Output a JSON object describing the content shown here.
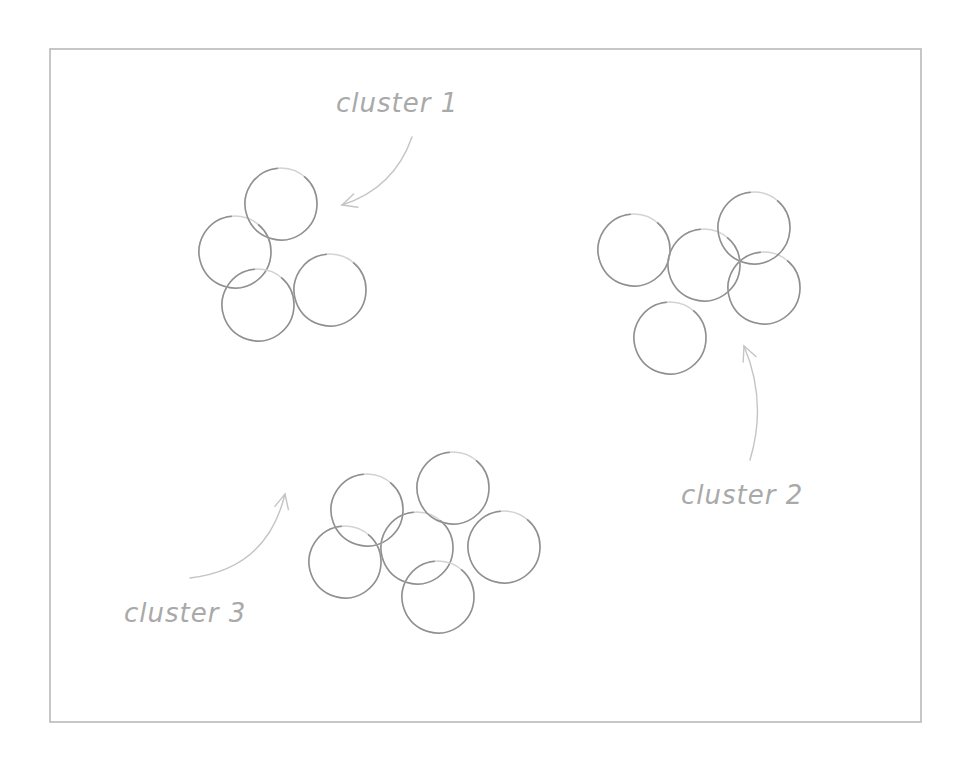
{
  "diagram": {
    "frame": {
      "x": 50,
      "y": 49,
      "width": 871,
      "height": 673
    },
    "colors": {
      "circle_stroke": "#8f8f8f",
      "label_text": "#a9a9a9",
      "arrow_stroke": "#c4c4c4",
      "frame_stroke": "#b9b9b9"
    },
    "clusters": [
      {
        "label": "cluster 1",
        "label_pos": {
          "x": 336,
          "y": 90
        },
        "arrow": {
          "from": [
            412,
            137
          ],
          "to": [
            342,
            205
          ]
        },
        "circles": [
          {
            "cx": 235,
            "cy": 252,
            "r": 36
          },
          {
            "cx": 281,
            "cy": 204,
            "r": 36
          },
          {
            "cx": 258,
            "cy": 305,
            "r": 36
          },
          {
            "cx": 330,
            "cy": 290,
            "r": 36
          }
        ]
      },
      {
        "label": "cluster 2",
        "label_pos": {
          "x": 681,
          "y": 482
        },
        "arrow": {
          "from": [
            750,
            460
          ],
          "to": [
            744,
            346
          ]
        },
        "circles": [
          {
            "cx": 634,
            "cy": 250,
            "r": 36
          },
          {
            "cx": 704,
            "cy": 265,
            "r": 36
          },
          {
            "cx": 764,
            "cy": 288,
            "r": 36
          },
          {
            "cx": 754,
            "cy": 228,
            "r": 36
          },
          {
            "cx": 670,
            "cy": 338,
            "r": 36
          }
        ]
      },
      {
        "label": "cluster 3",
        "label_pos": {
          "x": 124,
          "y": 600
        },
        "arrow": {
          "from": [
            190,
            578
          ],
          "to": [
            285,
            494
          ]
        },
        "circles": [
          {
            "cx": 345,
            "cy": 562,
            "r": 36
          },
          {
            "cx": 417,
            "cy": 548,
            "r": 36
          },
          {
            "cx": 367,
            "cy": 510,
            "r": 36
          },
          {
            "cx": 453,
            "cy": 488,
            "r": 36
          },
          {
            "cx": 504,
            "cy": 547,
            "r": 36
          },
          {
            "cx": 438,
            "cy": 597,
            "r": 36
          }
        ]
      }
    ]
  }
}
